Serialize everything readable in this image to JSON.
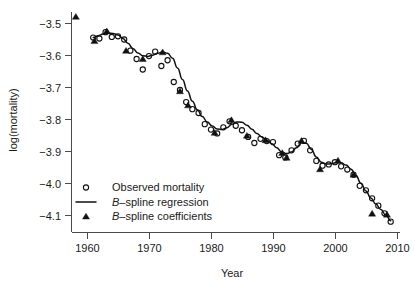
{
  "chart_data": {
    "type": "scatter",
    "title": "",
    "subtitle": "",
    "xlabel": "Year",
    "ylabel": "log(mortality)",
    "xlim": [
      1957.5,
      2010.5
    ],
    "ylim": [
      -4.155,
      -3.465
    ],
    "grid": false,
    "legend_position": "bottom-left",
    "xticks": [
      1960,
      1970,
      1980,
      1990,
      2000,
      2010
    ],
    "xtick_labels": [
      "1960",
      "1970",
      "1980",
      "1990",
      "2000",
      "2010"
    ],
    "yticks": [
      -3.5,
      -3.6,
      -3.7,
      -3.8,
      -3.9,
      -4.0,
      -4.1
    ],
    "ytick_labels": [
      "-3.5",
      "-3.6",
      "-3.7",
      "-3.8",
      "-3.9",
      "-4.0",
      "-4.1"
    ],
    "series": [
      {
        "name": "Observed mortality",
        "type": "scatter",
        "marker": "open-circle",
        "x": [
          1961,
          1962,
          1963,
          1964,
          1965,
          1966,
          1967,
          1968,
          1969,
          1970,
          1971,
          1972,
          1973,
          1974,
          1975,
          1976,
          1977,
          1978,
          1979,
          1980,
          1981,
          1982,
          1983,
          1984,
          1985,
          1986,
          1987,
          1988,
          1989,
          1990,
          1991,
          1992,
          1993,
          1994,
          1995,
          1996,
          1997,
          1998,
          1999,
          2000,
          2001,
          2002,
          2003,
          2004,
          2005,
          2006,
          2007,
          2008,
          2009
        ],
        "y": [
          -3.545,
          -3.548,
          -3.528,
          -3.543,
          -3.541,
          -3.551,
          -3.586,
          -3.612,
          -3.645,
          -3.603,
          -3.589,
          -3.634,
          -3.616,
          -3.684,
          -3.709,
          -3.747,
          -3.769,
          -3.781,
          -3.816,
          -3.833,
          -3.845,
          -3.826,
          -3.807,
          -3.821,
          -3.835,
          -3.856,
          -3.875,
          -3.862,
          -3.869,
          -3.872,
          -3.913,
          -3.92,
          -3.898,
          -3.877,
          -3.868,
          -3.898,
          -3.931,
          -3.946,
          -3.942,
          -3.935,
          -3.948,
          -3.958,
          -3.974,
          -4.009,
          -4.023,
          -4.048,
          -4.071,
          -4.095,
          -4.121
        ]
      },
      {
        "name": "B-spline coefficients",
        "type": "scatter",
        "marker": "filled-triangle",
        "x": [
          1958.2,
          1961.2,
          1963.2,
          1966.3,
          1969.0,
          1972.2,
          1975.0,
          1976.3,
          1980.6,
          1983.3,
          1985.8,
          1988.8,
          1991.5,
          1992.2,
          1994.6,
          1997.6,
          2000.5,
          2003.0,
          2006.0,
          2008.4
        ],
        "y": [
          -3.48,
          -3.556,
          -3.525,
          -3.586,
          -3.612,
          -3.591,
          -3.713,
          -3.757,
          -3.843,
          -3.803,
          -3.852,
          -3.866,
          -3.906,
          -3.921,
          -3.868,
          -3.957,
          -3.93,
          -3.974,
          -4.096,
          -4.099
        ]
      },
      {
        "name": "B-spline regression",
        "type": "line",
        "x": [
          1961.0,
          1961.8,
          1962.6,
          1963.4,
          1964.2,
          1965.0,
          1965.8,
          1966.6,
          1967.4,
          1968.2,
          1969.0,
          1969.8,
          1970.6,
          1971.4,
          1972.2,
          1973.0,
          1973.8,
          1974.6,
          1975.4,
          1976.2,
          1977.0,
          1977.8,
          1978.6,
          1979.4,
          1980.2,
          1981.0,
          1981.8,
          1982.6,
          1983.4,
          1984.2,
          1985.0,
          1985.8,
          1986.6,
          1987.4,
          1988.2,
          1989.0,
          1989.8,
          1990.6,
          1991.4,
          1992.2,
          1993.0,
          1993.8,
          1994.6,
          1995.4,
          1996.2,
          1997.0,
          1997.8,
          1998.6,
          1999.4,
          2000.2,
          2001.0,
          2001.8,
          2002.6,
          2003.4,
          2004.2,
          2005.0,
          2005.8,
          2006.6,
          2007.4,
          2008.2,
          2009.0
        ],
        "y": [
          -3.545,
          -3.539,
          -3.534,
          -3.531,
          -3.532,
          -3.537,
          -3.548,
          -3.563,
          -3.579,
          -3.593,
          -3.602,
          -3.604,
          -3.6,
          -3.594,
          -3.59,
          -3.594,
          -3.61,
          -3.64,
          -3.676,
          -3.712,
          -3.744,
          -3.771,
          -3.792,
          -3.809,
          -3.822,
          -3.831,
          -3.833,
          -3.827,
          -3.816,
          -3.809,
          -3.81,
          -3.819,
          -3.832,
          -3.845,
          -3.856,
          -3.866,
          -3.877,
          -3.89,
          -3.903,
          -3.908,
          -3.903,
          -3.89,
          -3.874,
          -3.876,
          -3.895,
          -3.919,
          -3.935,
          -3.941,
          -3.94,
          -3.936,
          -3.937,
          -3.944,
          -3.957,
          -3.977,
          -4.001,
          -4.025,
          -4.047,
          -4.066,
          -4.083,
          -4.1,
          -4.118
        ]
      }
    ],
    "legend": [
      {
        "label": "Observed mortality",
        "marker": "open-circle",
        "italic_prefix": ""
      },
      {
        "label": "spline regression",
        "marker": "line",
        "italic_prefix": "B"
      },
      {
        "label": "spline coefficients",
        "marker": "filled-triangle",
        "italic_prefix": "B"
      }
    ],
    "colors": {
      "line": "#111111",
      "marker": "#111111",
      "axis": "#4a4a4a",
      "background": "#ffffff",
      "text": "#1a1a1a"
    }
  }
}
